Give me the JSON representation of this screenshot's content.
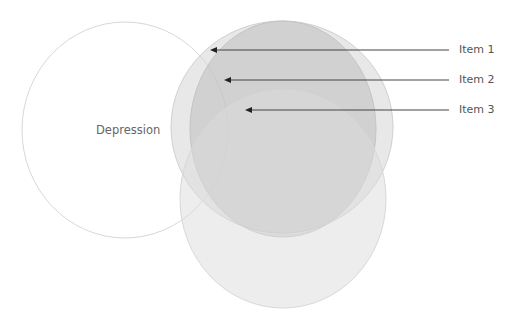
{
  "diagram": {
    "type": "venn",
    "circles": [
      {
        "id": "depression",
        "label": "Depression",
        "cx": 125,
        "cy": 130,
        "rx": 103,
        "ry": 108,
        "fill": "#ffffff",
        "fill_opacity": 0,
        "stroke": "#d8d8d8"
      },
      {
        "id": "item1",
        "label": "Item 1",
        "cx": 282,
        "cy": 127,
        "rx": 111,
        "ry": 106,
        "fill": "#d6d6d6",
        "fill_opacity": 0.55,
        "stroke": "#d0d0d0"
      },
      {
        "id": "item2",
        "label": "Item 2",
        "cx": 283,
        "cy": 129,
        "rx": 93,
        "ry": 108,
        "fill": "#bdbdbd",
        "fill_opacity": 0.55,
        "stroke": "#c4c4c4"
      },
      {
        "id": "item3",
        "label": "Item 3",
        "cx": 283,
        "cy": 199,
        "rx": 103,
        "ry": 109,
        "fill": "#dcdcdc",
        "fill_opacity": 0.5,
        "stroke": "#d8d8d8"
      }
    ],
    "center_label": "Depression",
    "callouts": [
      {
        "label": "Item 1",
        "y": 50,
        "x_start": 449,
        "x_end": 210
      },
      {
        "label": "Item 2",
        "y": 80,
        "x_start": 449,
        "x_end": 224
      },
      {
        "label": "Item 3",
        "y": 110,
        "x_start": 449,
        "x_end": 245
      }
    ],
    "arrow_color": "#444444"
  }
}
